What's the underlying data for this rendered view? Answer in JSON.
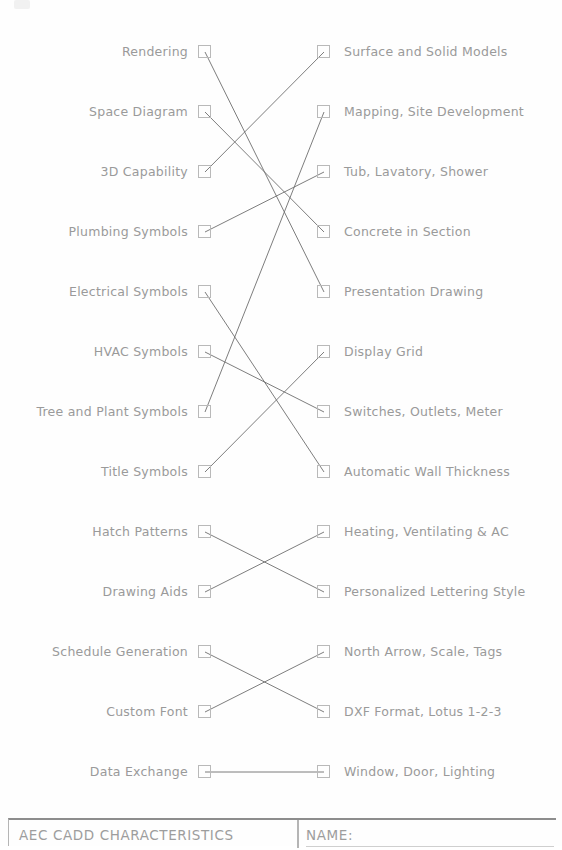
{
  "sheet": {
    "title_block": {
      "sheet_name": "AEC CADD CHARACTERISTICS",
      "name_field_label": "NAME:",
      "name_field_value": ""
    },
    "colors": {
      "ink": "#9a9a9a",
      "line": "#6e6e6e",
      "box_border": "#b9b9b9",
      "frame": "#8d8d8d",
      "paper": "#fefefe"
    }
  },
  "exercise": {
    "type": "matching-worksheet",
    "row_count": 14,
    "rows": [
      {
        "index": 0,
        "left": "Rendering",
        "right": "Surface and Solid Models"
      },
      {
        "index": 1,
        "left": "Space Diagram",
        "right": "Mapping, Site Development"
      },
      {
        "index": 2,
        "left": "3D Capability",
        "right": "Tub, Lavatory, Shower"
      },
      {
        "index": 3,
        "left": "Plumbing Symbols",
        "right": "Concrete in Section"
      },
      {
        "index": 4,
        "left": "Electrical Symbols",
        "right": "Presentation Drawing"
      },
      {
        "index": 5,
        "left": "HVAC Symbols",
        "right": "Display Grid"
      },
      {
        "index": 6,
        "left": "Tree and Plant Symbols",
        "right": "Switches, Outlets, Meter"
      },
      {
        "index": 7,
        "left": "Title Symbols",
        "right": "Automatic Wall Thickness"
      },
      {
        "index": 8,
        "left": "Hatch Patterns",
        "right": "Heating, Ventilating & AC"
      },
      {
        "index": 9,
        "left": "Drawing Aids",
        "right": "Personalized Lettering Style"
      },
      {
        "index": 10,
        "left": "Schedule Generation",
        "right": "North Arrow, Scale, Tags"
      },
      {
        "index": 11,
        "left": "Custom Font",
        "right": "DXF Format, Lotus 1-2-3"
      },
      {
        "index": 12,
        "left": "Data Exchange",
        "right": "Window, Door, Lighting"
      }
    ],
    "connections": [
      {
        "from_left": 0,
        "to_right": 4
      },
      {
        "from_left": 1,
        "to_right": 3
      },
      {
        "from_left": 2,
        "to_right": 0
      },
      {
        "from_left": 3,
        "to_right": 2
      },
      {
        "from_left": 4,
        "to_right": 7
      },
      {
        "from_left": 5,
        "to_right": 6
      },
      {
        "from_left": 6,
        "to_right": 1
      },
      {
        "from_left": 7,
        "to_right": 5
      },
      {
        "from_left": 8,
        "to_right": 9
      },
      {
        "from_left": 9,
        "to_right": 8
      },
      {
        "from_left": 10,
        "to_right": 11
      },
      {
        "from_left": 11,
        "to_right": 10
      },
      {
        "from_left": 12,
        "to_right": 12
      }
    ],
    "geometry": {
      "first_row_y": 52,
      "row_spacing": 60,
      "left_box_x": 205,
      "right_box_x": 324
    }
  }
}
